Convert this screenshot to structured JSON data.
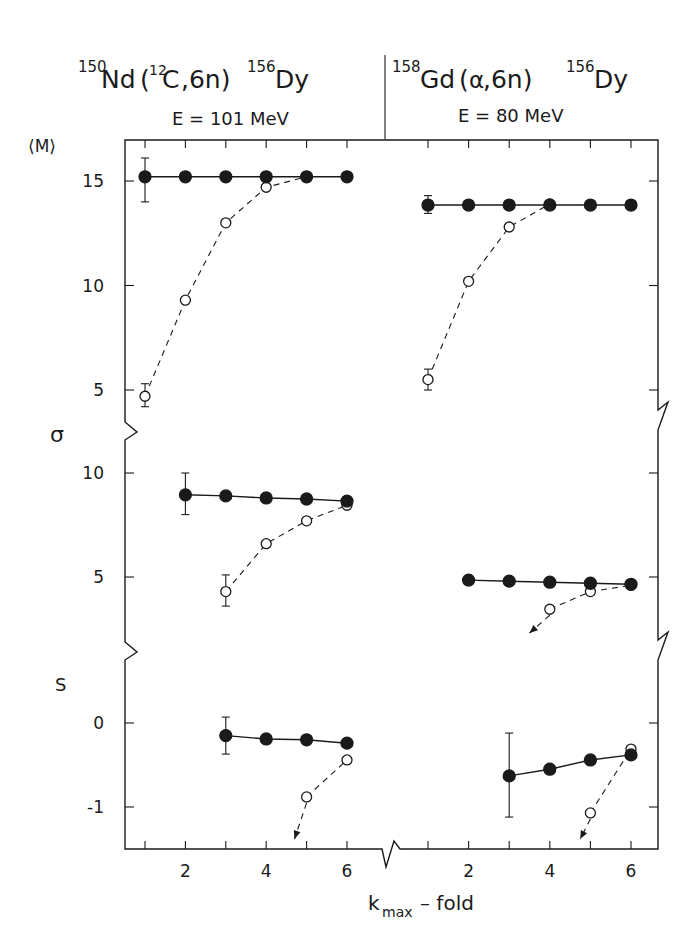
{
  "panels_header": {
    "left": {
      "target_mass": "150",
      "target": "Nd",
      "proj_mass": "12",
      "proj": "C",
      "channel": ",6n)",
      "product_mass": "156",
      "product": "Dy",
      "energy": "E = 101 MeV"
    },
    "right": {
      "target_mass": "158",
      "target": "Gd",
      "proj": "α",
      "channel": ",6n)",
      "product_mass": "156",
      "product": "Dy",
      "energy": "E = 80 MeV"
    }
  },
  "axis_labels": {
    "m": "⟨M⟩",
    "sigma": "σ",
    "s": "S",
    "x_main": "k",
    "x_sub": "max",
    "x_rest": "– fold"
  },
  "chart_data": {
    "type": "scatter",
    "xlabel": "k_max – fold",
    "x_ticks_labeled": [
      2,
      4,
      6
    ],
    "reactions": [
      "150Nd(12C,6n)156Dy, E=101 MeV",
      "158Gd(α,6n)156Dy, E=80 MeV"
    ],
    "series_legend": {
      "filled": "filled circles, solid line",
      "open": "open circles, dashed line"
    },
    "panels": [
      {
        "quantity": "⟨M⟩",
        "ylim": [
          3.5,
          16.9
        ],
        "yticks": [
          5,
          10,
          15
        ],
        "left": {
          "filled": {
            "k": [
              1,
              2,
              3,
              4,
              5,
              6
            ],
            "y": [
              15.2,
              15.2,
              15.2,
              15.2,
              15.2,
              15.2
            ],
            "err": {
              "k": 1,
              "lo": 14.0,
              "hi": 16.1
            }
          },
          "open": {
            "k": [
              1,
              2,
              3,
              4,
              5
            ],
            "y": [
              4.7,
              9.3,
              13.0,
              14.7,
              15.2
            ],
            "err": {
              "k": 1,
              "lo": 4.2,
              "hi": 5.3
            }
          }
        },
        "right": {
          "filled": {
            "k": [
              1,
              2,
              3,
              4,
              5,
              6
            ],
            "y": [
              13.85,
              13.85,
              13.85,
              13.85,
              13.85,
              13.85
            ],
            "err": {
              "k": 1,
              "lo": 13.45,
              "hi": 14.3
            }
          },
          "open": {
            "k": [
              1,
              2,
              3,
              4
            ],
            "y": [
              5.5,
              10.2,
              12.8,
              13.9
            ],
            "err": {
              "k": 1,
              "lo": 5.0,
              "hi": 6.0
            }
          }
        }
      },
      {
        "quantity": "σ",
        "ylim": [
          2.5,
          11.5
        ],
        "yticks": [
          5,
          10
        ],
        "left": {
          "filled": {
            "k": [
              2,
              3,
              4,
              5,
              6
            ],
            "y": [
              8.95,
              8.9,
              8.8,
              8.75,
              8.65
            ],
            "err": {
              "k": 2,
              "lo": 8.0,
              "hi": 10.0
            }
          },
          "open": {
            "k": [
              3,
              4,
              5,
              6
            ],
            "y": [
              4.3,
              6.6,
              7.7,
              8.45
            ],
            "err": {
              "k": 3,
              "lo": 3.6,
              "hi": 5.1
            }
          }
        },
        "right": {
          "filled": {
            "k": [
              2,
              3,
              4,
              5,
              6
            ],
            "y": [
              4.85,
              4.8,
              4.75,
              4.7,
              4.65
            ]
          },
          "open": {
            "k": [
              4,
              5,
              6
            ],
            "y": [
              3.45,
              4.3,
              4.6
            ],
            "arrow_to_k": 3.5
          }
        }
      },
      {
        "quantity": "S",
        "ylim": [
          -1.5,
          0.8
        ],
        "yticks": [
          0,
          -1
        ],
        "left": {
          "filled": {
            "k": [
              3,
              4,
              5,
              6
            ],
            "y": [
              -0.15,
              -0.19,
              -0.2,
              -0.24
            ],
            "err": {
              "k": 3,
              "lo": -0.37,
              "hi": 0.07
            }
          },
          "open": {
            "k": [
              5,
              6
            ],
            "y": [
              -0.88,
              -0.44
            ],
            "arrow_to_k": 4.7
          }
        },
        "right": {
          "filled": {
            "k": [
              3,
              4,
              5,
              6
            ],
            "y": [
              -0.63,
              -0.55,
              -0.44,
              -0.38
            ],
            "err": {
              "k": 3,
              "lo": -1.12,
              "hi": -0.12
            }
          },
          "open": {
            "k": [
              5,
              6
            ],
            "y": [
              -1.07,
              -0.31
            ],
            "arrow_to_k": 4.75
          }
        }
      }
    ]
  }
}
